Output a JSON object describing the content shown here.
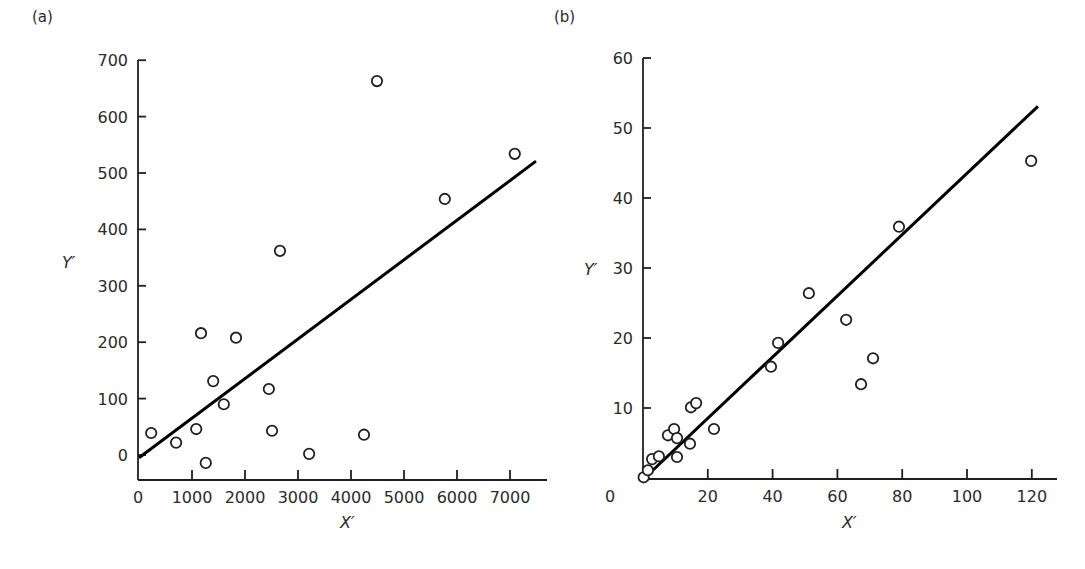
{
  "chart_data": [
    {
      "type": "scatter",
      "panel_label": "(a)",
      "title": "",
      "xlabel": "X′",
      "ylabel": "Y′",
      "xlim": [
        0,
        7700
      ],
      "ylim": [
        -45,
        700
      ],
      "x_ticks": [
        0,
        1000,
        2000,
        3000,
        4000,
        5000,
        6000,
        7000
      ],
      "y_ticks": [
        0,
        100,
        200,
        300,
        400,
        500,
        600,
        700
      ],
      "grid": false,
      "legend": null,
      "points": [
        {
          "x": 230,
          "y": 39
        },
        {
          "x": 700,
          "y": 22
        },
        {
          "x": 1080,
          "y": 46
        },
        {
          "x": 1170,
          "y": 216
        },
        {
          "x": 1260,
          "y": -14
        },
        {
          "x": 1400,
          "y": 131
        },
        {
          "x": 1600,
          "y": 90
        },
        {
          "x": 1830,
          "y": 208
        },
        {
          "x": 2450,
          "y": 117
        },
        {
          "x": 2510,
          "y": 43
        },
        {
          "x": 2660,
          "y": 362
        },
        {
          "x": 3210,
          "y": 2
        },
        {
          "x": 4245,
          "y": 36
        },
        {
          "x": 4490,
          "y": 663
        },
        {
          "x": 5770,
          "y": 454
        },
        {
          "x": 7090,
          "y": 534
        }
      ],
      "fit_line": {
        "x0": 0,
        "y0": -5,
        "x1": 7490,
        "y1": 521
      }
    },
    {
      "type": "scatter",
      "panel_label": "(b)",
      "title": "",
      "xlabel": "X′",
      "ylabel": "Y′",
      "xlim": [
        0,
        127
      ],
      "ylim": [
        0,
        60
      ],
      "x_ticks": [
        0,
        20,
        40,
        60,
        80,
        100,
        120
      ],
      "y_ticks": [
        10,
        20,
        30,
        40,
        50,
        60
      ],
      "grid": false,
      "legend": null,
      "points": [
        {
          "x": 0.2,
          "y": 0.1
        },
        {
          "x": 1.5,
          "y": 1.1
        },
        {
          "x": 2.8,
          "y": 2.7
        },
        {
          "x": 4.9,
          "y": 3.1
        },
        {
          "x": 7.7,
          "y": 6.1
        },
        {
          "x": 9.6,
          "y": 7.0
        },
        {
          "x": 10.5,
          "y": 5.7
        },
        {
          "x": 10.5,
          "y": 3.0
        },
        {
          "x": 14.5,
          "y": 4.9
        },
        {
          "x": 14.8,
          "y": 10.1
        },
        {
          "x": 16.4,
          "y": 10.7
        },
        {
          "x": 21.9,
          "y": 7.0
        },
        {
          "x": 39.5,
          "y": 15.9
        },
        {
          "x": 41.7,
          "y": 19.3
        },
        {
          "x": 51.2,
          "y": 26.4
        },
        {
          "x": 62.7,
          "y": 22.6
        },
        {
          "x": 67.3,
          "y": 13.4
        },
        {
          "x": 71.0,
          "y": 17.1
        },
        {
          "x": 79.0,
          "y": 35.9
        },
        {
          "x": 119.8,
          "y": 45.3
        }
      ],
      "fit_line": {
        "x0": 0.5,
        "y0": 0,
        "x1": 121.9,
        "y1": 53.1
      }
    }
  ],
  "layout": {
    "panels": [
      {
        "origin_px": [
          139,
          455
        ],
        "px_per_x": 0.053,
        "px_per_y": 0.564,
        "axis_left_px": 138,
        "axis_bottom_px": 480,
        "axis_right_px": 547,
        "axis_top_px": 60,
        "panel_label_pos": [
          32,
          22
        ],
        "ylabel_pos": [
          62,
          268
        ],
        "xlabel_pos": [
          340,
          528
        ],
        "y_tick_len": 8,
        "x_tick_len": 10
      },
      {
        "origin_px": [
          643,
          478
        ],
        "px_per_x": 3.24,
        "px_per_y": 7.0,
        "axis_left_px": 643,
        "axis_bottom_px": 479,
        "axis_right_px": 1057,
        "axis_top_px": 58,
        "panel_label_pos": [
          554,
          22
        ],
        "ylabel_pos": [
          584,
          275
        ],
        "xlabel_pos": [
          842,
          528
        ],
        "y_tick_len": 8,
        "x_tick_len": 10
      }
    ],
    "colors": {
      "ink": "#231f20",
      "background": "#ffffff"
    },
    "point_radius": 5.2
  }
}
